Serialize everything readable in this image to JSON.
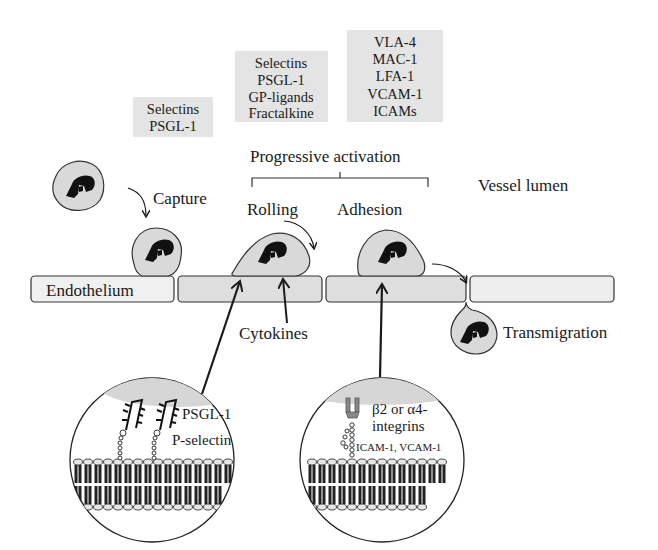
{
  "figure": {
    "region_label": "Vessel lumen",
    "progressive_activation_label": "Progressive activation",
    "endothelium_label": "Endothelium",
    "cytokines_label": "Cytokines"
  },
  "molecule_boxes": [
    {
      "lines": [
        "Selectins",
        "PSGL-1"
      ]
    },
    {
      "lines": [
        "Selectins",
        "PSGL-1",
        "GP-ligands",
        "Fractalkine"
      ]
    },
    {
      "lines": [
        "VLA-4",
        "MAC-1",
        "LFA-1",
        "VCAM-1",
        "ICAMs"
      ]
    }
  ],
  "stages": [
    {
      "label": "Capture"
    },
    {
      "label": "Rolling"
    },
    {
      "label": "Adhesion"
    },
    {
      "label": "Transmigration"
    }
  ],
  "insets": [
    {
      "labels": [
        "PSGL-1",
        "P-selectin"
      ]
    },
    {
      "labels": [
        "β2 or α4-",
        "integrins",
        "ICAM-1, VCAM-1"
      ]
    }
  ],
  "colors": {
    "box_fill": "#e4e4e4",
    "cell_fill": "#d9d9d9",
    "endothelium_fill": "#eeeeee",
    "endothelium_active_fill": "#dedede",
    "stroke": "#333333",
    "nucleus": "#111111"
  }
}
